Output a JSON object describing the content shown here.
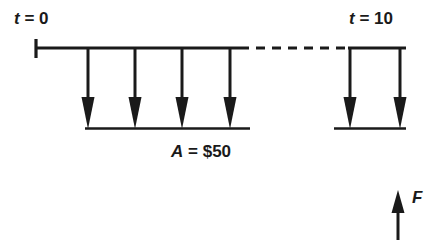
{
  "diagram": {
    "kind": "cash-flow-diagram",
    "background_color": "#ffffff",
    "stroke_color": "#1a1a1a",
    "labels": {
      "start_time": {
        "variable": "t",
        "operator": "=",
        "value": "0",
        "full": "t = 0"
      },
      "end_time": {
        "variable": "t",
        "operator": "=",
        "value": "10",
        "full": "t = 10"
      },
      "annuity": {
        "variable": "A",
        "operator": "=",
        "value": "$50",
        "full": "A = $50"
      },
      "future_value": {
        "variable": "F",
        "operator": "",
        "value": "",
        "full": "F"
      }
    },
    "timeline": {
      "y": 48,
      "start_x": 36,
      "end_x": 405,
      "tick_top_y": 39,
      "tick_bottom_y": 58,
      "solid_left_span": [
        36,
        240
      ],
      "dashed_span": [
        240,
        348
      ],
      "solid_right_span": [
        348,
        405
      ],
      "dash_pattern": "9 7"
    },
    "baselines": {
      "left": {
        "y": 128,
        "x_start": 85,
        "x_end": 250
      },
      "right": {
        "y": 128,
        "x_start": 334,
        "x_end": 406
      }
    },
    "down_arrows": {
      "description": "Equal annual payments A drawn downward from the timeline",
      "top_y": 48,
      "tip_y": 129,
      "x_positions": [
        88,
        135,
        182,
        230,
        350,
        400
      ],
      "count": 6,
      "visible_periods_left": 4,
      "visible_periods_right": 2
    },
    "up_arrow": {
      "description": "Future value F drawn upward at the end of the timeline",
      "x": 398,
      "bottom_y": 240,
      "tip_y": 190
    }
  }
}
